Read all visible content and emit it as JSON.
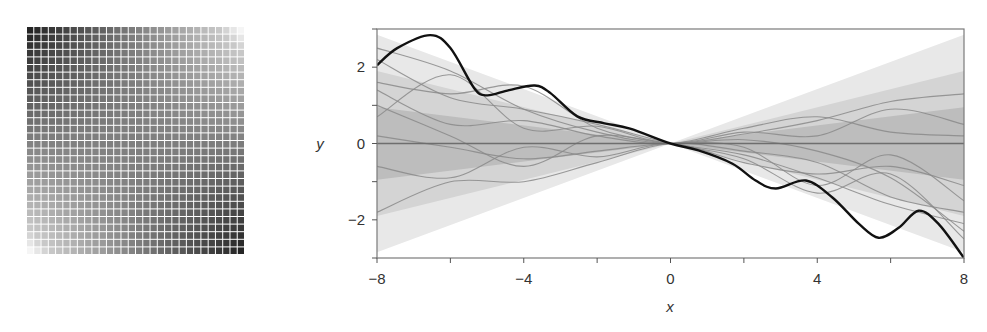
{
  "chart_data": [
    {
      "type": "heatmap",
      "title": "",
      "description": "Covariance matrix of a linear kernel: dark where x and x' share sign (top-left, bottom-right), light in opposite corners",
      "grid_size": [
        30,
        30
      ],
      "colormap": "grayscale (dark = high)",
      "corner_values": {
        "top_left": "dark",
        "top_right": "light",
        "bottom_left": "light",
        "bottom_right": "dark"
      },
      "grid_lines": true
    },
    {
      "type": "line",
      "title": "",
      "xlabel": "x",
      "ylabel": "y",
      "xlim": [
        -8,
        8
      ],
      "ylim": [
        -3,
        3
      ],
      "xticks": [
        -8,
        -6,
        -4,
        -2,
        0,
        2,
        4,
        6,
        8
      ],
      "xtick_labels": [
        "-8",
        "",
        "-4",
        "",
        "0",
        "",
        "4",
        "",
        "8"
      ],
      "yticks": [
        -3,
        -2,
        -1,
        0,
        1,
        2,
        3
      ],
      "ytick_labels": [
        "",
        "-2",
        "",
        "0",
        "",
        "2",
        ""
      ],
      "grid": false,
      "legend": null,
      "bands": {
        "description": "Shaded uncertainty bands, width proportional to |x|, pinched at x=0",
        "half_width_at_abs_x_8": [
          0.95,
          1.9,
          2.85
        ],
        "colors": [
          "#bdbdbd",
          "#d4d4d4",
          "#e8e8e8"
        ]
      },
      "series": [
        {
          "name": "mean",
          "color": "#6e6e6e",
          "x": [
            -8,
            8
          ],
          "y": [
            0,
            0
          ]
        },
        {
          "name": "highlighted sample",
          "color": "#111111",
          "x": [
            -8,
            -7.45,
            -6.55,
            -6.0,
            -5.35,
            -5.0,
            -4.4,
            -3.7,
            -3.27,
            -2.54,
            -1.8,
            -1.1,
            0,
            0.76,
            1.69,
            2.32,
            2.87,
            3.69,
            4.42,
            5.13,
            5.67,
            6.22,
            6.76,
            7.3,
            8
          ],
          "y": [
            2.05,
            2.5,
            2.84,
            2.5,
            1.45,
            1.26,
            1.4,
            1.52,
            1.32,
            0.71,
            0.53,
            0.39,
            0,
            -0.18,
            -0.53,
            -0.97,
            -1.18,
            -0.97,
            -1.42,
            -2.1,
            -2.47,
            -2.21,
            -1.76,
            -2.1,
            -3.0
          ]
        },
        {
          "name": "sample 1",
          "color": "#8a8a8a",
          "x": [
            -8,
            -6,
            -4,
            -2,
            0,
            2,
            4,
            6,
            8
          ],
          "y": [
            2.5,
            1.9,
            0.9,
            0.3,
            0,
            0.25,
            0.6,
            1.1,
            1.3
          ]
        },
        {
          "name": "sample 2",
          "color": "#8a8a8a",
          "x": [
            -8,
            -6,
            -4,
            -2,
            0,
            2,
            4,
            6,
            8
          ],
          "y": [
            1.6,
            1.3,
            1.5,
            0.4,
            0,
            -0.3,
            -0.9,
            -1.6,
            -2.1
          ]
        },
        {
          "name": "sample 3",
          "color": "#8a8a8a",
          "x": [
            -8,
            -6,
            -4,
            -2,
            0,
            2,
            4,
            6,
            8
          ],
          "y": [
            0.7,
            1.8,
            0.4,
            0.45,
            0,
            0.3,
            0.2,
            0.9,
            0.5
          ]
        },
        {
          "name": "sample 4",
          "color": "#8a8a8a",
          "x": [
            -8,
            -6,
            -4,
            -2,
            0,
            2,
            4,
            6,
            8
          ],
          "y": [
            -0.6,
            -0.9,
            -0.1,
            -0.35,
            0,
            -0.5,
            -0.8,
            -0.6,
            -1.1
          ]
        },
        {
          "name": "sample 5",
          "color": "#8a8a8a",
          "x": [
            -8,
            -6,
            -4,
            -2,
            0,
            2,
            4,
            6,
            8
          ],
          "y": [
            -1.8,
            -1.0,
            -1.0,
            -0.5,
            0,
            -0.2,
            -0.5,
            -1.4,
            -1.8
          ]
        },
        {
          "name": "sample 6",
          "color": "#8a8a8a",
          "x": [
            -8,
            -6,
            -4,
            -2,
            0,
            2,
            4,
            6,
            8
          ],
          "y": [
            1.0,
            0.2,
            -0.6,
            0.2,
            0,
            0.1,
            -0.2,
            -0.9,
            -2.3
          ]
        },
        {
          "name": "sample 7",
          "color": "#8a8a8a",
          "x": [
            -8,
            -6,
            -4,
            -2,
            0,
            2,
            4,
            6,
            8
          ],
          "y": [
            2.2,
            1.2,
            0.9,
            0.5,
            0,
            -0.4,
            -1.3,
            -0.8,
            -2.5
          ]
        },
        {
          "name": "sample 8",
          "color": "#8a8a8a",
          "x": [
            -8,
            -6,
            -4,
            -2,
            0,
            2,
            4,
            6,
            8
          ],
          "y": [
            1.4,
            0.5,
            0.6,
            0.2,
            0,
            0.4,
            0.7,
            0.3,
            0.2
          ]
        },
        {
          "name": "sample 9",
          "color": "#8a8a8a",
          "x": [
            -8,
            -6,
            -4,
            -2,
            0,
            2,
            4,
            6,
            8
          ],
          "y": [
            0.2,
            -0.1,
            -0.4,
            -0.2,
            0,
            -0.1,
            -1.1,
            -0.3,
            -1.5
          ]
        }
      ]
    }
  ],
  "labels": {
    "xlabel": "x",
    "ylabel": "y"
  }
}
